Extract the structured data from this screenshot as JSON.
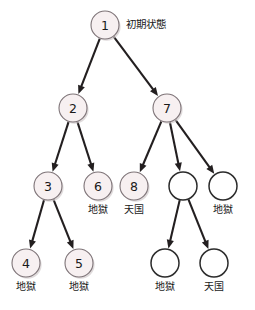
{
  "figure": {
    "title_label": "初期状態",
    "colors": {
      "node_fill": "#f7f0f1",
      "node_stroke": "#7d7377",
      "empty_node_fill": "#ffffff",
      "empty_node_stroke": "#2b2b2b",
      "edge": "#231f20",
      "background": "#ffffff",
      "text": "#1a1a1a"
    },
    "node_radius": 14,
    "empty_node_radius": 14
  },
  "chart_data": {
    "type": "diagram",
    "diagram_kind": "tree",
    "title": "初期状態",
    "nodes": [
      {
        "id": "n1",
        "number": "1",
        "label": "",
        "x": 105,
        "y": 25,
        "style": "filled",
        "side_label": "初期状態"
      },
      {
        "id": "n2",
        "number": "2",
        "label": "",
        "x": 73,
        "y": 108,
        "style": "filled",
        "side_label": ""
      },
      {
        "id": "n7",
        "number": "7",
        "label": "",
        "x": 167,
        "y": 108,
        "style": "filled",
        "side_label": ""
      },
      {
        "id": "n3",
        "number": "3",
        "label": "",
        "x": 48,
        "y": 186,
        "style": "filled",
        "side_label": ""
      },
      {
        "id": "n6",
        "number": "6",
        "label": "地獄",
        "x": 98,
        "y": 186,
        "style": "filled",
        "side_label": ""
      },
      {
        "id": "n8",
        "number": "8",
        "label": "天国",
        "x": 134,
        "y": 186,
        "style": "filled",
        "side_label": ""
      },
      {
        "id": "e1",
        "number": "",
        "label": "",
        "x": 183,
        "y": 186,
        "style": "empty",
        "side_label": ""
      },
      {
        "id": "e2",
        "number": "",
        "label": "地獄",
        "x": 223,
        "y": 186,
        "style": "empty",
        "side_label": ""
      },
      {
        "id": "n4",
        "number": "4",
        "label": "地獄",
        "x": 26,
        "y": 263,
        "style": "filled",
        "side_label": ""
      },
      {
        "id": "n5",
        "number": "5",
        "label": "地獄",
        "x": 79,
        "y": 263,
        "style": "filled",
        "side_label": ""
      },
      {
        "id": "e3",
        "number": "",
        "label": "地獄",
        "x": 165,
        "y": 263,
        "style": "empty",
        "side_label": ""
      },
      {
        "id": "e4",
        "number": "",
        "label": "天国",
        "x": 214,
        "y": 263,
        "style": "empty",
        "side_label": ""
      }
    ],
    "edges": [
      {
        "from": "n1",
        "to": "n2"
      },
      {
        "from": "n1",
        "to": "n7"
      },
      {
        "from": "n2",
        "to": "n3"
      },
      {
        "from": "n2",
        "to": "n6"
      },
      {
        "from": "n7",
        "to": "n8"
      },
      {
        "from": "n7",
        "to": "e1"
      },
      {
        "from": "n7",
        "to": "e2"
      },
      {
        "from": "n3",
        "to": "n4"
      },
      {
        "from": "n3",
        "to": "n5"
      },
      {
        "from": "e1",
        "to": "e3"
      },
      {
        "from": "e1",
        "to": "e4"
      }
    ]
  }
}
